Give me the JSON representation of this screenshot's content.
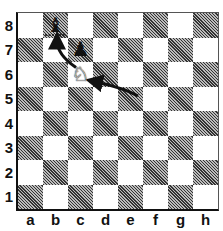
{
  "board": {
    "files": [
      "a",
      "b",
      "c",
      "d",
      "e",
      "f",
      "g",
      "h"
    ],
    "ranks": [
      "8",
      "7",
      "6",
      "5",
      "4",
      "3",
      "2",
      "1"
    ],
    "pieces": [
      {
        "square": "b8",
        "piece": "bishop",
        "color": "black",
        "glyph": "♝"
      },
      {
        "square": "c7",
        "piece": "pawn",
        "color": "black",
        "glyph": "♟"
      },
      {
        "square": "c6",
        "piece": "knight",
        "color": "white",
        "glyph": "♘"
      }
    ],
    "arrows": [
      {
        "from": "e5",
        "to": "c6"
      },
      {
        "from": "c6",
        "to": "b8"
      }
    ],
    "highlight": "b8"
  }
}
